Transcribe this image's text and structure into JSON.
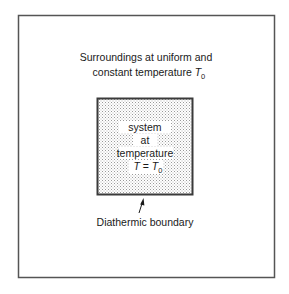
{
  "diagram": {
    "surroundings": {
      "line1": "Surroundings at uniform and",
      "line2_prefix": "constant temperature ",
      "symbol": "T",
      "subscript": "0"
    },
    "system": {
      "line1": "system",
      "line2": "at",
      "line3": "temperature",
      "equation_lhs": "T",
      "equation_op": " = ",
      "equation_rhs": "T",
      "equation_rhs_subscript": "0"
    },
    "boundary_label": "Diathermic boundary",
    "colors": {
      "line": "#555555",
      "stipple_fill": "#d4d4d4",
      "background": "#ffffff"
    }
  }
}
